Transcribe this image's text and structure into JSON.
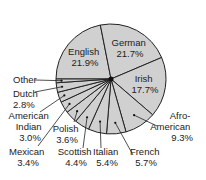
{
  "chart_data": {
    "type": "pie",
    "title": "",
    "slices": [
      {
        "label": "English",
        "value": 21.9,
        "display": "21.9%"
      },
      {
        "label": "German",
        "value": 21.7,
        "display": "21.7%"
      },
      {
        "label": "Irish",
        "value": 17.7,
        "display": "17.7%"
      },
      {
        "label": "Afro-American",
        "value": 9.3,
        "display": "9.3%"
      },
      {
        "label": "French",
        "value": 5.7,
        "display": "5.7%"
      },
      {
        "label": "Italian",
        "value": 5.4,
        "display": "5.4%"
      },
      {
        "label": "Scottish",
        "value": 4.4,
        "display": "4.4%"
      },
      {
        "label": "Polish",
        "value": 3.6,
        "display": "3.6%"
      },
      {
        "label": "Mexican",
        "value": 3.4,
        "display": "3.4%"
      },
      {
        "label": "American Indian",
        "value": 3.0,
        "display": "3.0%"
      },
      {
        "label": "Dutch",
        "value": 2.8,
        "display": "2.8%"
      },
      {
        "label": "Other",
        "value": 1.1,
        "display": ""
      }
    ],
    "colors": {
      "fill": "#d0d0d0",
      "stroke": "#222222",
      "text": "#222222"
    },
    "legend": "none (labels placed on/around slices)"
  },
  "labels": {
    "english": [
      "English",
      "21.9%"
    ],
    "german": [
      "German",
      "21.7%"
    ],
    "irish": [
      "Irish",
      "17.7%"
    ],
    "afro": [
      "Afro-",
      "American",
      "9.3%"
    ],
    "french": [
      "French",
      "5.7%"
    ],
    "italian": [
      "Italian",
      "5.4%"
    ],
    "scottish": [
      "Scottish",
      "4.4%"
    ],
    "polish": [
      "Polish",
      "3.6%"
    ],
    "mexican": [
      "Mexican",
      "3.4%"
    ],
    "amindian": [
      "American",
      "Indian",
      "3.0%"
    ],
    "dutch": [
      "Dutch",
      "2.8%"
    ],
    "other": [
      "Other"
    ]
  }
}
